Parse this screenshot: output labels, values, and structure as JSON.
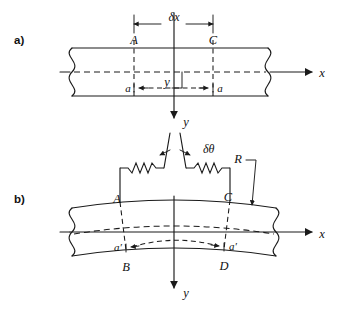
{
  "figure": {
    "ink_color": "#1a1a1a",
    "background": "#ffffff"
  },
  "panels": [
    {
      "id": "a",
      "label": "a)",
      "caption": "Undeformed straight beam element"
    },
    {
      "id": "b",
      "label": "b)",
      "caption": "Deformed curved beam element"
    }
  ],
  "panel_a": {
    "dimension_label": "δx",
    "section_left": "A",
    "section_right": "C",
    "fiber_left": "a",
    "fiber_right": "a",
    "depth_label": "y",
    "axis_x": "x",
    "axis_y": "y"
  },
  "panel_b": {
    "angle_label": "δθ",
    "radius_label": "R",
    "section_top_left": "A",
    "section_top_right": "C",
    "section_bottom_left": "B",
    "section_bottom_right": "D",
    "fiber_left": "a′",
    "fiber_right": "a′",
    "axis_x": "x",
    "axis_y": "y"
  }
}
